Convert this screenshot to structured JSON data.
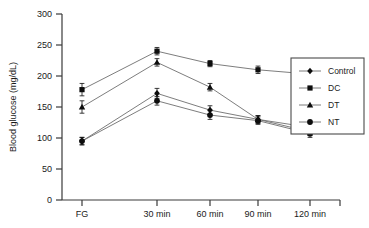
{
  "chart_data": {
    "type": "line",
    "title": "",
    "xlabel": "",
    "ylabel": "Blood glucose (mg/dL)",
    "categories": [
      "FG",
      "30 min",
      "60 min",
      "90 min",
      "120 min"
    ],
    "ylim": [
      0,
      300
    ],
    "yticks": [
      0,
      50,
      100,
      150,
      200,
      250,
      300
    ],
    "ytick_labels": [
      "0",
      "50",
      "100",
      "150",
      "200",
      "250",
      "300"
    ],
    "grid": false,
    "legend_position": "right",
    "error_bars": true,
    "series": [
      {
        "name": "Control",
        "marker": "diamond",
        "values": [
          95,
          172,
          145,
          130,
          110
        ],
        "errors": [
          6,
          8,
          7,
          6,
          6
        ]
      },
      {
        "name": "DC",
        "marker": "square",
        "values": [
          178,
          240,
          220,
          210,
          203
        ],
        "errors": [
          10,
          6,
          5,
          6,
          5
        ]
      },
      {
        "name": "DT",
        "marker": "triangle",
        "values": [
          150,
          222,
          182,
          130,
          117
        ],
        "errors": [
          10,
          6,
          6,
          6,
          7
        ]
      },
      {
        "name": "NT",
        "marker": "circle",
        "values": [
          95,
          160,
          137,
          128,
          107
        ],
        "errors": [
          6,
          7,
          7,
          6,
          6
        ]
      }
    ]
  },
  "colors": {
    "axis": "#3a3a3a",
    "line": "#6e6e6e",
    "marker": "#0d0d0d",
    "text": "#1a1a1a",
    "legend_border": "#4a4a4a",
    "background": "#ffffff"
  },
  "axis": {
    "y_title": "Blood glucose (mg/dL)",
    "y_tick_0": "0",
    "y_tick_50": "50",
    "y_tick_100": "100",
    "y_tick_150": "150",
    "y_tick_200": "200",
    "y_tick_250": "250",
    "y_tick_300": "300",
    "x_tick_0": "FG",
    "x_tick_1": "30 min",
    "x_tick_2": "60 min",
    "x_tick_3": "90 min",
    "x_tick_4": "120 min"
  },
  "legend": {
    "items": [
      {
        "label": "Control",
        "marker": "diamond"
      },
      {
        "label": "DC",
        "marker": "square"
      },
      {
        "label": "DT",
        "marker": "triangle"
      },
      {
        "label": "NT",
        "marker": "circle"
      }
    ]
  }
}
